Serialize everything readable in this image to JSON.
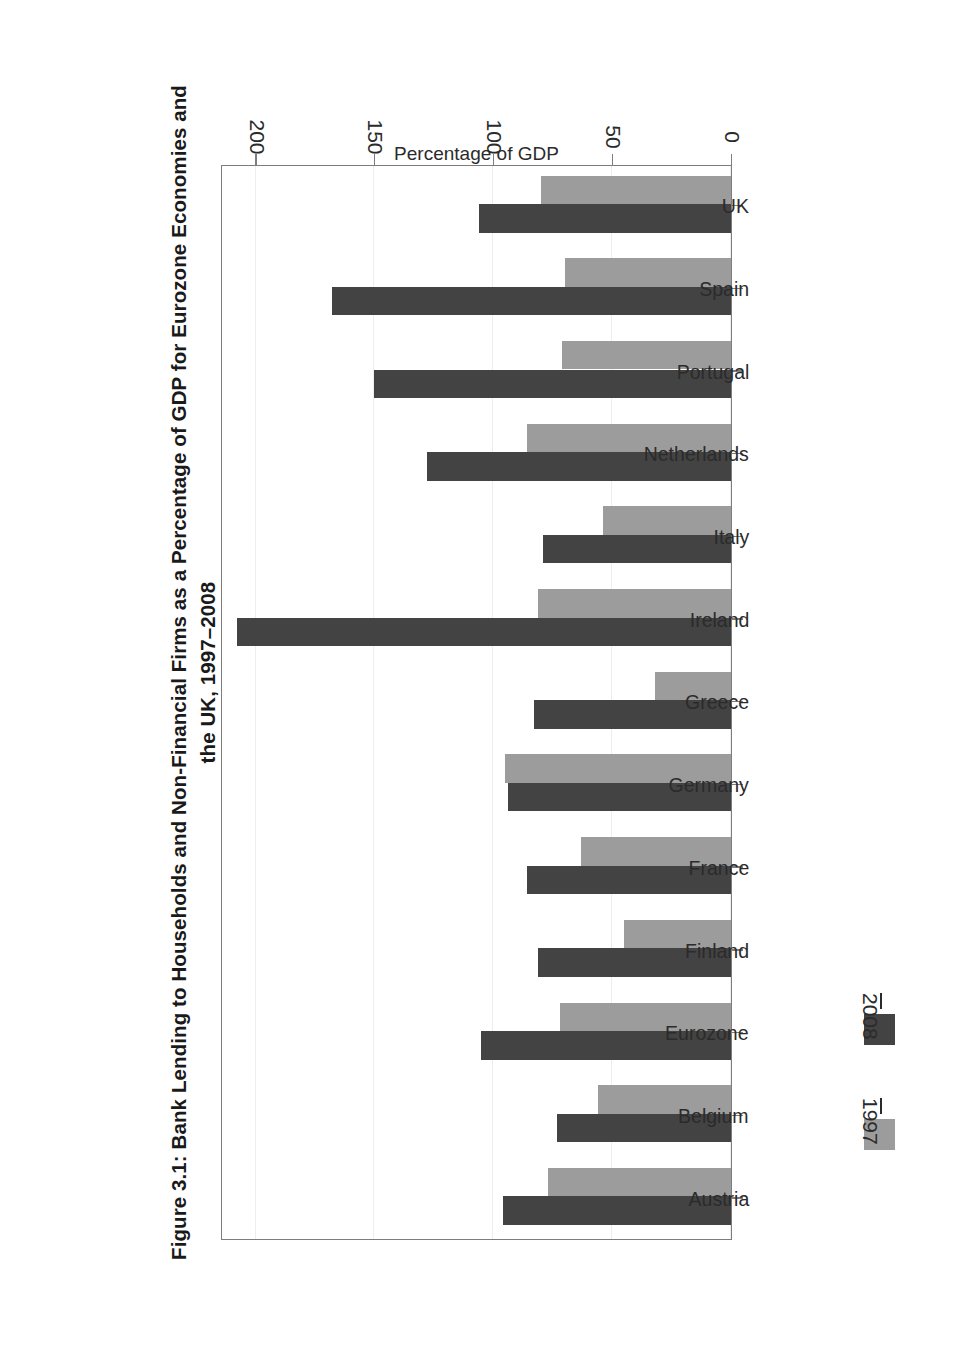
{
  "figure": {
    "title": "Figure 3.1: Bank Lending to Households and Non-Financial Firms as a Percentage of GDP for Eurozone Economies and the UK, 1997–2008",
    "background_color": "#ffffff",
    "frame_color": "#7d7d7d"
  },
  "legend": {
    "position": "bottom-left",
    "entries": [
      {
        "label": "1997",
        "color": "#9c9c9c"
      },
      {
        "label": "2008",
        "color": "#434343"
      }
    ]
  },
  "axes": {
    "value_axis_title": "Percentage of GDP",
    "value_ticks": [
      "0",
      "50",
      "100",
      "150",
      "200"
    ],
    "category_axis_title": ""
  },
  "chart_data": {
    "type": "bar",
    "orientation": "horizontal",
    "title": "Figure 3.1: Bank Lending to Households and Non-Financial Firms as a Percentage of GDP for Eurozone Economies and the UK, 1997–2008",
    "xlabel": "Percentage of GDP",
    "ylabel": "",
    "xlim": [
      0,
      215
    ],
    "xticks": [
      0,
      50,
      100,
      150,
      200
    ],
    "grid": true,
    "legend_position": "bottom-left",
    "categories": [
      "Austria",
      "Belgium",
      "Eurozone",
      "Finland",
      "France",
      "Germany",
      "Greece",
      "Ireland",
      "Italy",
      "Netherlands",
      "Portugal",
      "Spain",
      "UK"
    ],
    "series": [
      {
        "name": "1997",
        "color": "#9c9c9c",
        "values": [
          77,
          56,
          72,
          45,
          63,
          95,
          32,
          81,
          54,
          86,
          71,
          70,
          80
        ]
      },
      {
        "name": "2008",
        "color": "#434343",
        "values": [
          96,
          73,
          105,
          81,
          86,
          94,
          83,
          208,
          79,
          128,
          150,
          168,
          106
        ]
      }
    ]
  }
}
